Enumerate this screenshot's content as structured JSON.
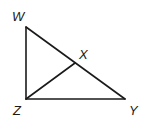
{
  "diagram": {
    "type": "right-triangle-with-altitude",
    "vertices": {
      "W": {
        "label": "W",
        "x": 26,
        "y": 27
      },
      "Z": {
        "label": "Z",
        "x": 26,
        "y": 99
      },
      "Y": {
        "label": "Y",
        "x": 125,
        "y": 99
      },
      "X": {
        "label": "X",
        "x": 75,
        "y": 63
      }
    },
    "segments": [
      {
        "from": "W",
        "to": "Z"
      },
      {
        "from": "Z",
        "to": "Y"
      },
      {
        "from": "W",
        "to": "Y"
      },
      {
        "from": "Z",
        "to": "X"
      }
    ],
    "labels": {
      "W": "W",
      "X": "X",
      "Z": "Z",
      "Y": "Y"
    },
    "colors": {
      "stroke": "#1a1a1a",
      "background": "#ffffff"
    }
  }
}
